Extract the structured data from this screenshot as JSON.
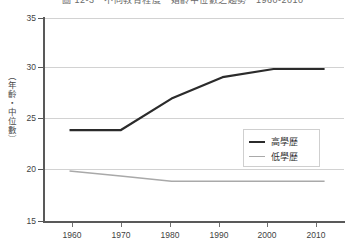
{
  "title": "圖 12-3　不同教育程度　婚齡中位數之趨勢　1960-2010",
  "axis": {
    "ylabel": "（年齡‧中位數）",
    "yticks": [
      35,
      30,
      25,
      20,
      15
    ],
    "xticks": [
      "1960",
      "1970",
      "1980",
      "1990",
      "2000",
      "2010"
    ]
  },
  "legend": {
    "items": [
      {
        "label": "高學歷",
        "color": "#2b2b2b",
        "width": "2.2px"
      },
      {
        "label": "低學歷",
        "color": "#a9a9a9",
        "width": "1.5px"
      }
    ]
  },
  "chart_data": {
    "type": "line",
    "title": "圖 12-3　不同教育程度　婚齡中位數之趨勢　1960-2010",
    "xlabel": "",
    "ylabel": "（年齡‧中位數）",
    "x": [
      1960,
      1970,
      1980,
      1990,
      2000,
      2010
    ],
    "xlim": [
      1955,
      2014
    ],
    "ylim": [
      15,
      35
    ],
    "yticks": [
      15,
      20,
      25,
      30,
      35
    ],
    "grid": true,
    "legend_position": "inside-lower-right",
    "series": [
      {
        "name": "高學歷",
        "color": "#2b2b2b",
        "values": [
          24.0,
          24.0,
          27.1,
          29.2,
          30.0,
          30.0
        ]
      },
      {
        "name": "低學歷",
        "color": "#a9a9a9",
        "values": [
          20.0,
          19.5,
          19.0,
          19.0,
          19.0,
          19.0
        ]
      }
    ]
  }
}
